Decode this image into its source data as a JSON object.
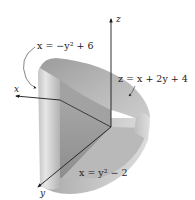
{
  "figure": {
    "labels": {
      "x_axis": "x",
      "y_axis": "y",
      "z_axis": "z",
      "surface_back": "x = −y² + 6",
      "surface_top": "z = x + 2y + 4",
      "surface_front": "x = y² − 2"
    },
    "colors": {
      "background": "#ffffff",
      "axis": "#1a1a1a",
      "solid_light": "#d6d6d6",
      "solid_mid": "#b4b4b4",
      "solid_dark": "#8f8f8f",
      "label": "#222222"
    }
  }
}
